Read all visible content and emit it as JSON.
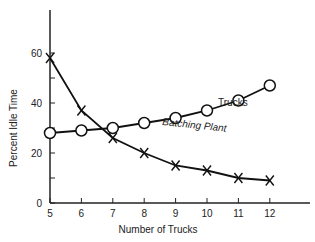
{
  "chart_data": {
    "type": "line",
    "title": "",
    "xlabel": "Number of Trucks",
    "ylabel": "Percent Idle Time",
    "x": [
      5,
      6,
      7,
      8,
      9,
      10,
      11,
      12
    ],
    "xlim": [
      5,
      13
    ],
    "ylim": [
      0,
      75
    ],
    "x_ticks": [
      5,
      6,
      7,
      8,
      9,
      10,
      11,
      12
    ],
    "y_ticks": [
      0,
      20,
      40,
      60
    ],
    "y_minor_ticks": [
      10,
      30,
      50
    ],
    "grid": false,
    "legend": "inline labels",
    "series": [
      {
        "name": "Trucks",
        "marker": "circle",
        "values": [
          28,
          29,
          30,
          32,
          34,
          37,
          41,
          47
        ]
      },
      {
        "name": "Batching Plant",
        "marker": "x",
        "values": [
          58,
          37,
          26,
          20,
          15,
          13,
          10,
          9
        ]
      }
    ]
  },
  "labels": {
    "trucks": "Trucks",
    "batching": "Batching Plant",
    "xlabel": "Number of Trucks",
    "ylabel": "Percent Idle Time"
  }
}
